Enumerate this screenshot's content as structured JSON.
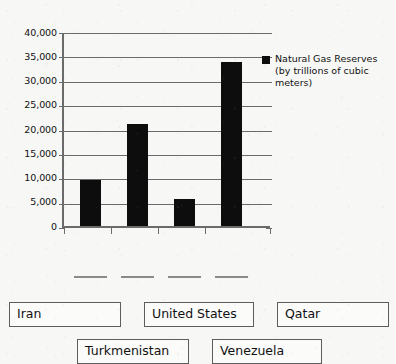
{
  "chart_data": {
    "type": "bar",
    "title": "",
    "xlabel": "",
    "ylabel": "",
    "ylim": [
      0,
      40000
    ],
    "ytick_interval": 5000,
    "grid": true,
    "legend_position": "right",
    "categories": [
      "",
      "",
      "",
      ""
    ],
    "values": [
      9400,
      21000,
      5600,
      33700
    ],
    "ytick_labels": [
      "40,000",
      "35,000",
      "30,000",
      "25,000",
      "20,000",
      "15,000",
      "10,000",
      "5,000",
      "0"
    ],
    "ytick_values": [
      40000,
      35000,
      30000,
      25000,
      20000,
      15000,
      10000,
      5000,
      0
    ],
    "series": [
      {
        "name": "Natural Gas Reserves (by trillions of cubic meters)",
        "values": [
          9400,
          21000,
          5600,
          33700
        ],
        "color": "#0d0d0d"
      }
    ],
    "legend": [
      {
        "label": "Natural Gas Reserves (by trillions of cubic meters)",
        "color": "#0d0d0d"
      }
    ]
  },
  "legend": {
    "line1": "Natural Gas Reserves",
    "line2": "(by trillions of cubic",
    "line3": "meters)",
    "swatch_name": "legend-swatch-black"
  },
  "dropzones": [
    {
      "id": "dropzone-1",
      "label": ""
    },
    {
      "id": "dropzone-2",
      "label": ""
    },
    {
      "id": "dropzone-3",
      "label": ""
    },
    {
      "id": "dropzone-4",
      "label": ""
    }
  ],
  "tokens": [
    {
      "id": "token-iran",
      "label": "Iran"
    },
    {
      "id": "token-united-states",
      "label": "United States"
    },
    {
      "id": "token-qatar",
      "label": "Qatar"
    },
    {
      "id": "token-turkmenistan",
      "label": "Turkmenistan"
    },
    {
      "id": "token-venezuela",
      "label": "Venezuela"
    }
  ],
  "colors": {
    "bar": "#0d0d0d",
    "axis": "#6b6b6b",
    "background": "#f7f7f5",
    "token_border": "#5d5d5d",
    "text": "#111111"
  }
}
